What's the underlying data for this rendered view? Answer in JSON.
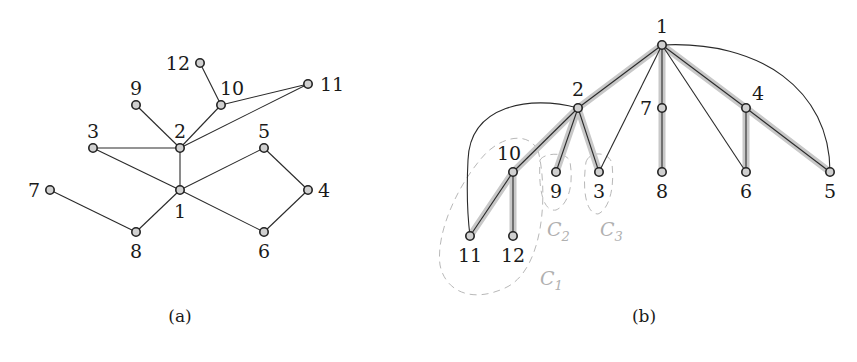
{
  "figure": {
    "panels": [
      {
        "id": "a",
        "caption": "(a)",
        "caption_pos": [
          180,
          322
        ],
        "nodes": [
          {
            "id": "1",
            "x": 180,
            "y": 190,
            "lx": 180,
            "ly": 218,
            "anchor": "middle"
          },
          {
            "id": "2",
            "x": 180,
            "y": 148,
            "lx": 180,
            "ly": 138,
            "anchor": "middle"
          },
          {
            "id": "3",
            "x": 93,
            "y": 148,
            "lx": 93,
            "ly": 138,
            "anchor": "middle"
          },
          {
            "id": "4",
            "x": 308,
            "y": 190,
            "lx": 318,
            "ly": 197,
            "anchor": "start"
          },
          {
            "id": "5",
            "x": 264,
            "y": 148,
            "lx": 264,
            "ly": 138,
            "anchor": "middle"
          },
          {
            "id": "6",
            "x": 264,
            "y": 232,
            "lx": 264,
            "ly": 258,
            "anchor": "middle"
          },
          {
            "id": "7",
            "x": 50,
            "y": 190,
            "lx": 40,
            "ly": 197,
            "anchor": "end"
          },
          {
            "id": "8",
            "x": 136,
            "y": 232,
            "lx": 136,
            "ly": 258,
            "anchor": "middle"
          },
          {
            "id": "9",
            "x": 136,
            "y": 105,
            "lx": 136,
            "ly": 95,
            "anchor": "middle"
          },
          {
            "id": "10",
            "x": 221,
            "y": 105,
            "lx": 232,
            "ly": 95,
            "anchor": "middle"
          },
          {
            "id": "11",
            "x": 308,
            "y": 84,
            "lx": 320,
            "ly": 91,
            "anchor": "start"
          },
          {
            "id": "12",
            "x": 200,
            "y": 63,
            "lx": 190,
            "ly": 70,
            "anchor": "end"
          }
        ],
        "edges": [
          [
            "1",
            "2"
          ],
          [
            "1",
            "3"
          ],
          [
            "1",
            "5"
          ],
          [
            "1",
            "6"
          ],
          [
            "1",
            "8"
          ],
          [
            "2",
            "3"
          ],
          [
            "2",
            "9"
          ],
          [
            "2",
            "10"
          ],
          [
            "2",
            "11"
          ],
          [
            "10",
            "12"
          ],
          [
            "10",
            "11"
          ],
          [
            "5",
            "4"
          ],
          [
            "4",
            "6"
          ],
          [
            "7",
            "8"
          ]
        ]
      },
      {
        "id": "b",
        "caption": "(b)",
        "caption_pos": [
          644,
          322
        ],
        "nodes": [
          {
            "id": "1",
            "x": 662,
            "y": 45,
            "lx": 662,
            "ly": 33,
            "anchor": "middle"
          },
          {
            "id": "2",
            "x": 578,
            "y": 108,
            "lx": 578,
            "ly": 96,
            "anchor": "middle"
          },
          {
            "id": "7",
            "x": 662,
            "y": 108,
            "lx": 652,
            "ly": 115,
            "anchor": "end"
          },
          {
            "id": "4",
            "x": 746,
            "y": 108,
            "lx": 752,
            "ly": 100,
            "anchor": "start"
          },
          {
            "id": "10",
            "x": 513,
            "y": 172,
            "lx": 509,
            "ly": 160,
            "anchor": "middle"
          },
          {
            "id": "9",
            "x": 556,
            "y": 172,
            "lx": 556,
            "ly": 198,
            "anchor": "middle"
          },
          {
            "id": "3",
            "x": 599,
            "y": 172,
            "lx": 599,
            "ly": 198,
            "anchor": "middle"
          },
          {
            "id": "8",
            "x": 662,
            "y": 172,
            "lx": 662,
            "ly": 198,
            "anchor": "middle"
          },
          {
            "id": "6",
            "x": 746,
            "y": 172,
            "lx": 746,
            "ly": 198,
            "anchor": "middle"
          },
          {
            "id": "5",
            "x": 830,
            "y": 172,
            "lx": 830,
            "ly": 198,
            "anchor": "middle"
          },
          {
            "id": "11",
            "x": 470,
            "y": 236,
            "lx": 470,
            "ly": 262,
            "anchor": "middle"
          },
          {
            "id": "12",
            "x": 513,
            "y": 236,
            "lx": 513,
            "ly": 262,
            "anchor": "middle"
          }
        ],
        "tree_edges": [
          [
            "1",
            "2"
          ],
          [
            "1",
            "7"
          ],
          [
            "7",
            "8"
          ],
          [
            "1",
            "4"
          ],
          [
            "4",
            "6"
          ],
          [
            "4",
            "5"
          ],
          [
            "2",
            "10"
          ],
          [
            "2",
            "9"
          ],
          [
            "2",
            "3"
          ],
          [
            "10",
            "11"
          ],
          [
            "10",
            "12"
          ]
        ],
        "back_edges": [
          [
            "1",
            "3"
          ],
          [
            "1",
            "6"
          ]
        ],
        "curved_edges": [
          {
            "from": "1",
            "to": "5",
            "d": "M 662 45 C 760 40, 830 90, 830 172"
          },
          {
            "from": "2",
            "to": "11",
            "d": "M 578 108 C 530 95, 470 105, 468 160 C 466 200, 468 220, 470 236"
          }
        ],
        "clusters": [
          {
            "name": "C",
            "sub": "1",
            "d": "M 538 150 C 548 190, 545 270, 505 288 C 470 304, 445 290, 440 265 C 436 235, 455 190, 480 160 C 495 140, 525 128, 538 150 Z",
            "lx": 540,
            "ly": 285
          },
          {
            "name": "C",
            "sub": "2",
            "d": "M 540 160 C 545 152, 568 152, 570 162 C 574 185, 568 205, 556 210 C 545 212, 538 195, 540 160 Z",
            "lx": 547,
            "ly": 236
          },
          {
            "name": "C",
            "sub": "3",
            "d": "M 586 162 C 590 150, 610 152, 612 164 C 615 190, 608 210, 598 214 C 586 214, 582 190, 586 162 Z",
            "lx": 600,
            "ly": 236
          }
        ]
      }
    ]
  }
}
